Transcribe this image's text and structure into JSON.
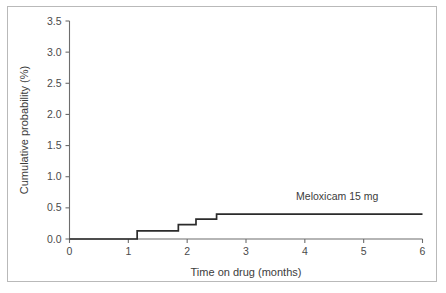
{
  "figure": {
    "background_color": "#ffffff",
    "frame_color": "#b9b9b9",
    "axis_color": "#6d6d6d",
    "series_color": "#2b2b2b"
  },
  "chart_data": {
    "type": "line",
    "subtype": "step",
    "title": "",
    "subtitle": "",
    "xlabel": "Time on drug (months)",
    "ylabel": "Cumulative probability (%)",
    "xlim": [
      0,
      6
    ],
    "ylim": [
      0.0,
      3.5
    ],
    "grid": false,
    "legend_position": "inline-annotation-right",
    "xticks": [
      0,
      1,
      2,
      3,
      4,
      5,
      6
    ],
    "xtick_labels": [
      "0",
      "1",
      "2",
      "3",
      "4",
      "5",
      "6"
    ],
    "yticks": [
      0.0,
      0.5,
      1.0,
      1.5,
      2.0,
      2.5,
      3.0,
      3.5
    ],
    "ytick_labels": [
      "0.0",
      "0.5",
      "1.0",
      "1.5",
      "2.0",
      "2.5",
      "3.0",
      "3.5"
    ],
    "annotations": [
      {
        "text": "Meloxicam 15 mg",
        "x": 4.55,
        "y": 0.62
      }
    ],
    "series": [
      {
        "name": "Meloxicam 15 mg",
        "color": "#2b2b2b",
        "step_mode": "post",
        "x": [
          0.0,
          1.15,
          1.15,
          1.85,
          1.85,
          2.15,
          2.15,
          2.5,
          2.5,
          6.0
        ],
        "y": [
          0.0,
          0.0,
          0.13,
          0.13,
          0.23,
          0.23,
          0.32,
          0.32,
          0.4,
          0.4
        ],
        "points": [
          {
            "x": 0.0,
            "y": 0.0
          },
          {
            "x": 1.15,
            "y": 0.13
          },
          {
            "x": 1.85,
            "y": 0.23
          },
          {
            "x": 2.15,
            "y": 0.32
          },
          {
            "x": 2.5,
            "y": 0.4
          },
          {
            "x": 6.0,
            "y": 0.4
          }
        ]
      }
    ]
  }
}
